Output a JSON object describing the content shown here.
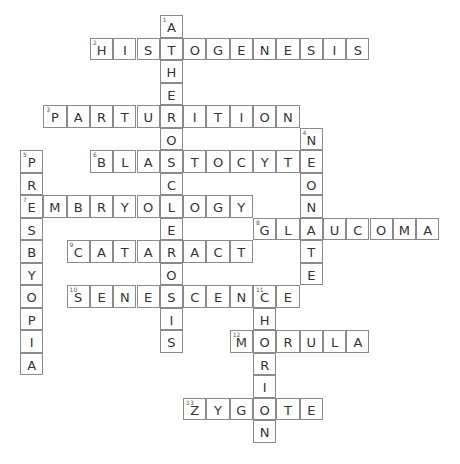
{
  "puzzle": {
    "type": "crossword",
    "grid": {
      "origin_x": 20,
      "origin_y": 15,
      "cell_w": 23.3,
      "cell_h": 22.5
    },
    "entries": [
      {
        "number": 1,
        "direction": "down",
        "answer": "ATHEROSCLEROSIS",
        "row": 0,
        "col": 6
      },
      {
        "number": 2,
        "direction": "across",
        "answer": "HISTOGENESIS",
        "row": 1,
        "col": 3
      },
      {
        "number": 3,
        "direction": "across",
        "answer": "PARTURITION",
        "row": 4,
        "col": 1
      },
      {
        "number": 4,
        "direction": "down",
        "answer": "NEONATE",
        "row": 5,
        "col": 12
      },
      {
        "number": 5,
        "direction": "down",
        "answer": "PRESBYOPIA",
        "row": 6,
        "col": 0
      },
      {
        "number": 6,
        "direction": "across",
        "answer": "BLASTOCYTE",
        "row": 6,
        "col": 3
      },
      {
        "number": 7,
        "direction": "across",
        "answer": "EMBRYOLOGY",
        "row": 8,
        "col": 0
      },
      {
        "number": 8,
        "direction": "across",
        "answer": "GLAUCOMA",
        "row": 9,
        "col": 10
      },
      {
        "number": 9,
        "direction": "across",
        "answer": "CATARACT",
        "row": 10,
        "col": 2
      },
      {
        "number": 10,
        "direction": "across",
        "answer": "SENESCENCE",
        "row": 12,
        "col": 2
      },
      {
        "number": 11,
        "direction": "down",
        "answer": "CHORION",
        "row": 12,
        "col": 10
      },
      {
        "number": 12,
        "direction": "across",
        "answer": "MORULA",
        "row": 14,
        "col": 9
      },
      {
        "number": 13,
        "direction": "across",
        "answer": "ZYGOTE",
        "row": 17,
        "col": 7
      }
    ]
  }
}
